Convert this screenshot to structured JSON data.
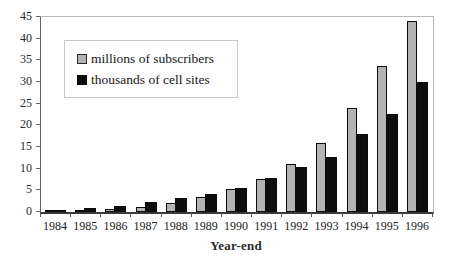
{
  "chart_data": {
    "type": "bar",
    "title": "",
    "xlabel": "Year-end",
    "ylabel": "",
    "categories": [
      "1984",
      "1985",
      "1986",
      "1987",
      "1988",
      "1989",
      "1990",
      "1991",
      "1992",
      "1993",
      "1994",
      "1995",
      "1996"
    ],
    "series": [
      {
        "name": "millions of subscribers",
        "color": "#b3b3b3",
        "values": [
          0.1,
          0.3,
          0.7,
          1.2,
          2.1,
          3.5,
          5.3,
          7.6,
          11.0,
          16.0,
          24.1,
          33.8,
          44.0
        ]
      },
      {
        "name": "thousands of cell sites",
        "color": "#0d0d0d",
        "values": [
          0.3,
          0.9,
          1.5,
          2.3,
          3.2,
          4.2,
          5.6,
          7.8,
          10.3,
          12.8,
          17.9,
          22.7,
          30.1
        ]
      }
    ],
    "ylim": [
      0,
      45
    ],
    "yticks": [
      0,
      5,
      10,
      15,
      20,
      25,
      30,
      35,
      40,
      45
    ],
    "grid": false,
    "legend_position": "upper-left-inside",
    "bar_border_color": "#0a0a0a",
    "axis_color": "#3a3a3a",
    "frame_color": "#b8b8b8"
  }
}
